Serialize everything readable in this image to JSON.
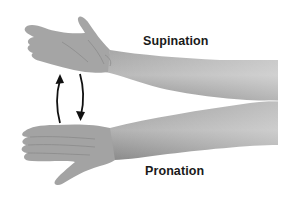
{
  "diagram": {
    "labels": {
      "supination": "Supination",
      "pronation": "Pronation"
    },
    "elements": {
      "upper_arm": "supinated forearm and hand (palm up)",
      "lower_arm": "pronated forearm and hand (palm down)",
      "arrow_up": "curved arrow pointing up (pronation to supination)",
      "arrow_down": "curved arrow pointing down (supination to pronation)"
    },
    "colors": {
      "skin_light": "#b8b8b8",
      "skin_mid": "#9a9a9a",
      "skin_dark": "#7a7a7a",
      "arrow": "#111111",
      "text": "#1a1a1a",
      "background": "#ffffff"
    }
  }
}
